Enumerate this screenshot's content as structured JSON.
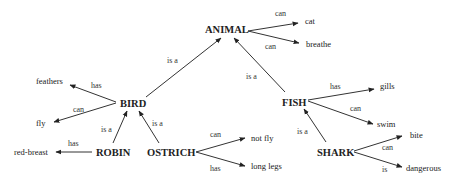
{
  "diagram": {
    "type": "semantic-network",
    "nodes": {
      "animal": "ANIMAL",
      "bird": "BIRD",
      "fish": "FISH",
      "robin": "ROBIN",
      "ostrich": "OSTRICH",
      "shark": "SHARK"
    },
    "leaves": {
      "cat": "cat",
      "breathe": "breathe",
      "feathers": "feathers",
      "fly": "fly",
      "red_breast": "red-breast",
      "not_fly": "not fly",
      "long_legs": "long legs",
      "gills": "gills",
      "swim": "swim",
      "bite": "bite",
      "dangerous": "dangerous"
    },
    "relations": {
      "animal_cat": "can",
      "animal_breathe": "can",
      "bird_animal": "is a",
      "fish_animal": "is a",
      "bird_feathers": "has",
      "bird_fly": "can",
      "robin_bird": "is a",
      "ostrich_bird": "is a",
      "robin_redbreast": "has",
      "ostrich_notfly": "can",
      "ostrich_longlegs": "has",
      "fish_gills": "has",
      "fish_swim": "can",
      "shark_fish": "is a",
      "shark_bite": "can",
      "shark_dangerous": "is"
    },
    "edges": [
      {
        "from": "ANIMAL",
        "to": "cat",
        "label": "can"
      },
      {
        "from": "ANIMAL",
        "to": "breathe",
        "label": "can"
      },
      {
        "from": "BIRD",
        "to": "ANIMAL",
        "label": "is a"
      },
      {
        "from": "FISH",
        "to": "ANIMAL",
        "label": "is a"
      },
      {
        "from": "BIRD",
        "to": "feathers",
        "label": "has"
      },
      {
        "from": "BIRD",
        "to": "fly",
        "label": "can"
      },
      {
        "from": "ROBIN",
        "to": "BIRD",
        "label": "is a"
      },
      {
        "from": "OSTRICH",
        "to": "BIRD",
        "label": "is a"
      },
      {
        "from": "ROBIN",
        "to": "red-breast",
        "label": "has"
      },
      {
        "from": "OSTRICH",
        "to": "not fly",
        "label": "can"
      },
      {
        "from": "OSTRICH",
        "to": "long legs",
        "label": "has"
      },
      {
        "from": "FISH",
        "to": "gills",
        "label": "has"
      },
      {
        "from": "FISH",
        "to": "swim",
        "label": "can"
      },
      {
        "from": "SHARK",
        "to": "FISH",
        "label": "is a"
      },
      {
        "from": "SHARK",
        "to": "bite",
        "label": "can"
      },
      {
        "from": "SHARK",
        "to": "dangerous",
        "label": "is"
      }
    ]
  }
}
